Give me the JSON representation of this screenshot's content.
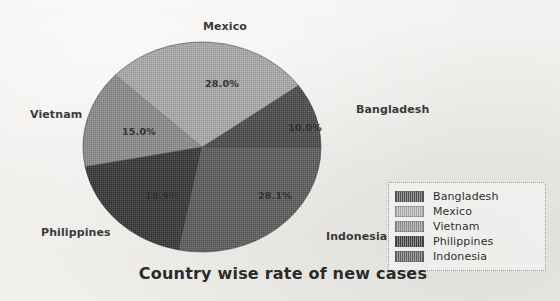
{
  "chart_data": {
    "type": "pie",
    "title": "Country wise rate of new cases",
    "categories": [
      "Bangladesh",
      "Mexico",
      "Vietnam",
      "Philippines",
      "Indonesia"
    ],
    "values": [
      10.0,
      28.0,
      15.0,
      18.9,
      28.1
    ],
    "value_labels": [
      "10.0%",
      "28.0%",
      "15.0%",
      "18.9%",
      "28.1%"
    ],
    "unit": "%",
    "start_angle_deg": 0,
    "direction": "counterclockwise",
    "legend_position": "right",
    "grid": false,
    "colors": [
      "#4f4f4f",
      "#a8a8a8",
      "#8c8c8c",
      "#3c3c3c",
      "#5f5f5f"
    ],
    "slices": [
      {
        "label": "Bangladesh",
        "value": 10.0,
        "value_label": "10.0%",
        "color": "#4f4f4f"
      },
      {
        "label": "Mexico",
        "value": 28.0,
        "value_label": "28.0%",
        "color": "#a8a8a8"
      },
      {
        "label": "Vietnam",
        "value": 15.0,
        "value_label": "15.0%",
        "color": "#8c8c8c"
      },
      {
        "label": "Philippines",
        "value": 18.9,
        "value_label": "18.9%",
        "color": "#3c3c3c"
      },
      {
        "label": "Indonesia",
        "value": 28.1,
        "value_label": "28.1%",
        "color": "#5f5f5f"
      }
    ]
  },
  "legend": {
    "items": [
      {
        "label": "Bangladesh"
      },
      {
        "label": "Mexico"
      },
      {
        "label": "Vietnam"
      },
      {
        "label": "Philippines"
      },
      {
        "label": "Indonesia"
      }
    ]
  },
  "callouts": {
    "mexico": "Mexico",
    "bangladesh": "Bangladesh",
    "vietnam": "Vietnam",
    "philippines": "Philippines",
    "indonesia": "Indonesia"
  }
}
